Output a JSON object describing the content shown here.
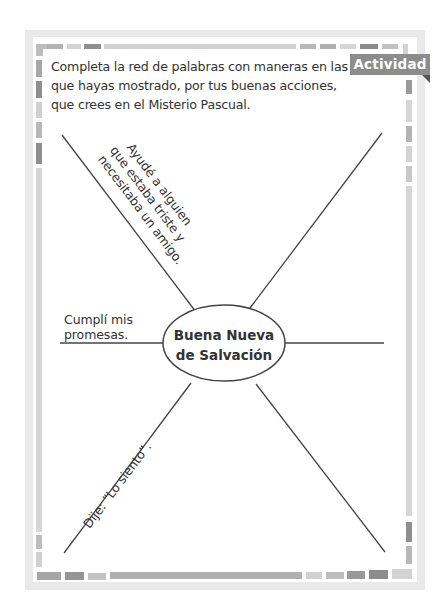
{
  "activity": {
    "badge_label": "Actividad",
    "instructions": "Completa la red de palabras con maneras en las que hayas mostrado, por tus buenas acciones, que crees en el Misterio Pascual."
  },
  "word_web": {
    "center_label_line1": "Buena Nueva",
    "center_label_line2": "de Salvación",
    "answers": [
      {
        "position": "upper-left",
        "line1": "Ayudé a alguien",
        "line2": "que estaba triste y",
        "line3": "necesitaba un amigo."
      },
      {
        "position": "left",
        "line1": "Cumplí mis",
        "line2": "promesas."
      },
      {
        "position": "lower-left",
        "line1": "Dije: “Lo siento”."
      },
      {
        "position": "upper-right",
        "line1": ""
      },
      {
        "position": "right",
        "line1": ""
      },
      {
        "position": "lower-right",
        "line1": ""
      }
    ]
  },
  "colors": {
    "frame": "#e9e9e9",
    "badge": "#8c8c8c",
    "line": "#444444",
    "text": "#333333"
  }
}
